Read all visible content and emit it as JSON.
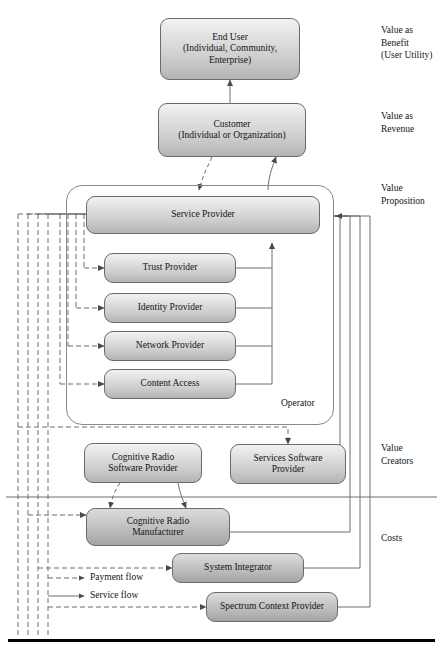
{
  "figure": {
    "type": "value-network-diagram"
  },
  "nodes": {
    "end_user": {
      "line1": "End User",
      "line2": "(Individual, Community,",
      "line3": "Enterprise)"
    },
    "customer": {
      "line1": "Customer",
      "line2": "(Individual or Organization)"
    },
    "service_provider": {
      "label": "Service Provider"
    },
    "trust_provider": {
      "label": "Trust Provider"
    },
    "identity_provider": {
      "label": "Identity Provider"
    },
    "network_provider": {
      "label": "Network Provider"
    },
    "content_access": {
      "label": "Content Access"
    },
    "cognitive_radio_software_provider": {
      "line1": "Cognitive Radio",
      "line2": "Software Provider"
    },
    "services_software_provider": {
      "line1": "Services Software",
      "line2": "Provider"
    },
    "cognitive_radio_manufacturer": {
      "line1": "Cognitive Radio",
      "line2": "Manufacturer"
    },
    "system_integrator": {
      "label": "System Integrator"
    },
    "spectrum_context_provider": {
      "label": "Spectrum Context Provider"
    }
  },
  "groups": {
    "operator": {
      "label": "Operator"
    }
  },
  "side_labels": {
    "value_as_benefit": "Value as\nBenefit\n(User Utility)",
    "value_as_revenue": "Value as\nRevenue",
    "value_proposition": "Value\nProposition",
    "value_creators": "Value\nCreators",
    "costs": "Costs"
  },
  "legend": {
    "payment_flow": "Payment flow",
    "service_flow": "Service flow"
  },
  "colors": {
    "node_fill_light": "#e2e2e2",
    "node_fill_dark": "#b6b6b6",
    "node_border": "#6b6b6b",
    "line": "#6e6e6e",
    "text": "#151515",
    "rule": "#000000"
  }
}
